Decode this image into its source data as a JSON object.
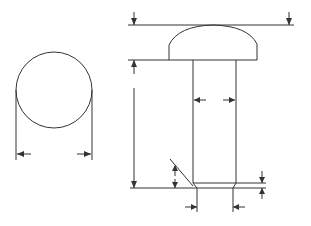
{
  "diagram": {
    "type": "technical-drawing",
    "colors": {
      "background": "#ffffff",
      "line": "#333333"
    },
    "views": [
      {
        "id": "end-view",
        "shape": "circle",
        "dimensions": [
          {
            "id": "diameter",
            "orientation": "horizontal",
            "label": ""
          }
        ]
      },
      {
        "id": "side-view",
        "shape": "round-head rivet",
        "dimensions": [
          {
            "id": "overall-height-arrows-top",
            "orientation": "vertical",
            "label": ""
          },
          {
            "id": "head-width",
            "orientation": "horizontal",
            "label": ""
          },
          {
            "id": "shank-length",
            "orientation": "vertical",
            "label": ""
          },
          {
            "id": "shank-diameter",
            "orientation": "horizontal",
            "label": ""
          },
          {
            "id": "chamfer-height",
            "orientation": "vertical",
            "label": ""
          },
          {
            "id": "chamfer-width",
            "orientation": "horizontal",
            "label": ""
          },
          {
            "id": "end-chamfer-depth",
            "orientation": "vertical",
            "label": ""
          }
        ]
      }
    ]
  }
}
